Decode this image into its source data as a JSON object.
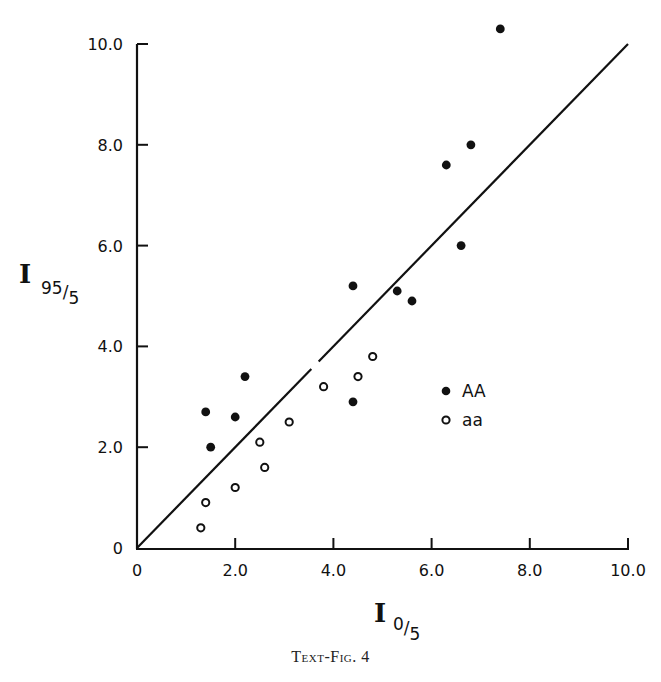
{
  "chart_data": {
    "type": "scatter",
    "title": "",
    "caption": "Text-Fig. 4",
    "xlabel": {
      "main": "I",
      "sub": "0/5"
    },
    "ylabel": {
      "main": "I",
      "sub": "95/5"
    },
    "xlim": [
      0,
      10
    ],
    "ylim": [
      0,
      10
    ],
    "x_ticks": [
      "0",
      "2.0",
      "4.0",
      "6.0",
      "8.0",
      "10.0"
    ],
    "y_ticks": [
      "0",
      "2.0",
      "4.0",
      "6.0",
      "8.0",
      "10.0"
    ],
    "grid": false,
    "legend_position": "inside-right-center",
    "reference_line": {
      "type": "identity",
      "from": [
        0,
        0
      ],
      "to": [
        10,
        10
      ],
      "label": "y = x"
    },
    "series": [
      {
        "name": "AA",
        "marker": "filled-circle",
        "color": "#111111",
        "points": [
          [
            7.4,
            10.3
          ],
          [
            6.8,
            8.0
          ],
          [
            6.3,
            7.6
          ],
          [
            6.6,
            6.0
          ],
          [
            4.4,
            5.2
          ],
          [
            5.3,
            5.1
          ],
          [
            5.6,
            4.9
          ],
          [
            2.2,
            3.4
          ],
          [
            1.4,
            2.7
          ],
          [
            2.0,
            2.6
          ],
          [
            1.5,
            2.0
          ],
          [
            4.4,
            2.9
          ]
        ]
      },
      {
        "name": "aa",
        "marker": "open-circle",
        "color": "#111111",
        "points": [
          [
            4.8,
            3.8
          ],
          [
            4.5,
            3.4
          ],
          [
            3.8,
            3.2
          ],
          [
            3.1,
            2.5
          ],
          [
            2.5,
            2.1
          ],
          [
            2.6,
            1.6
          ],
          [
            2.0,
            1.2
          ],
          [
            1.4,
            0.9
          ],
          [
            1.3,
            0.4
          ]
        ]
      }
    ]
  },
  "layout": {
    "origin_px": [
      137,
      548
    ],
    "x_max_px": 628,
    "y_max_px": 44
  }
}
